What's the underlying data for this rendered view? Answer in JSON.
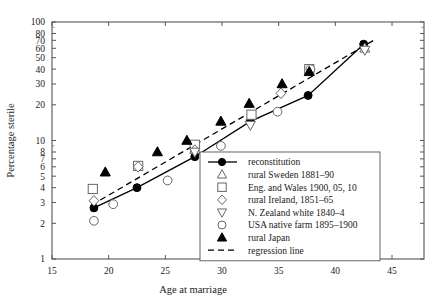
{
  "chart_data": {
    "type": "scatter",
    "title": "",
    "xlabel": "Age at marriage",
    "ylabel": "Percentage sterile",
    "xlim": [
      15,
      45
    ],
    "ylim": [
      1,
      100
    ],
    "yscale": "log",
    "grid": false,
    "legend_position": "bottom-right",
    "x_ticks": [
      15,
      20,
      25,
      30,
      35,
      40,
      45
    ],
    "y_ticks": [
      1,
      2,
      3,
      4,
      5,
      6,
      7,
      8,
      10,
      20,
      30,
      40,
      50,
      60,
      70,
      80,
      100
    ],
    "series": [
      {
        "name": "reconstitution",
        "marker": "filled-circle",
        "line": "solid",
        "points": [
          {
            "x": 18.7,
            "y": 2.7
          },
          {
            "x": 22.5,
            "y": 4.0
          },
          {
            "x": 27.6,
            "y": 7.3
          },
          {
            "x": 32.5,
            "y": 14.5
          },
          {
            "x": 37.6,
            "y": 24.0
          },
          {
            "x": 42.5,
            "y": 65.0
          }
        ]
      },
      {
        "name": "rural Sweden 1881–90",
        "marker": "triangle-up-open",
        "line": "none",
        "points": [
          {
            "x": 27.6,
            "y": 8.4
          },
          {
            "x": 42.6,
            "y": 60.0
          }
        ]
      },
      {
        "name": "Eng. and Wales 1900, 05, 10",
        "marker": "square-open",
        "line": "none",
        "points": [
          {
            "x": 18.6,
            "y": 3.9
          },
          {
            "x": 22.6,
            "y": 6.1
          },
          {
            "x": 27.6,
            "y": 9.2
          },
          {
            "x": 32.6,
            "y": 16.5
          },
          {
            "x": 37.7,
            "y": 40.0
          }
        ]
      },
      {
        "name": "rural Ireland, 1851–65",
        "marker": "diamond-open",
        "line": "none",
        "points": [
          {
            "x": 18.7,
            "y": 3.1
          },
          {
            "x": 22.6,
            "y": 6.0
          },
          {
            "x": 27.6,
            "y": 8.3
          },
          {
            "x": 35.2,
            "y": 25.0
          }
        ]
      },
      {
        "name": "N. Zealand white 1840–4",
        "marker": "triangle-down-open",
        "line": "none",
        "points": [
          {
            "x": 27.6,
            "y": 8.0
          },
          {
            "x": 32.5,
            "y": 13.5
          },
          {
            "x": 42.6,
            "y": 58.0
          }
        ]
      },
      {
        "name": "USA native farm 1895–1900",
        "marker": "circle-open",
        "line": "none",
        "points": [
          {
            "x": 18.7,
            "y": 2.1
          },
          {
            "x": 20.4,
            "y": 2.9
          },
          {
            "x": 25.2,
            "y": 4.6
          },
          {
            "x": 29.9,
            "y": 9.0
          },
          {
            "x": 34.9,
            "y": 17.5
          },
          {
            "x": 37.8,
            "y": 40.0
          }
        ]
      },
      {
        "name": "rural Japan",
        "marker": "triangle-up-filled",
        "line": "none",
        "points": [
          {
            "x": 19.7,
            "y": 5.4
          },
          {
            "x": 24.3,
            "y": 8.0
          },
          {
            "x": 26.9,
            "y": 10.0
          },
          {
            "x": 29.9,
            "y": 14.5
          },
          {
            "x": 32.4,
            "y": 20.5
          },
          {
            "x": 35.3,
            "y": 30.0
          },
          {
            "x": 37.7,
            "y": 38.0
          }
        ]
      }
    ],
    "regression_line": {
      "name": "regression line",
      "style": "dashed",
      "endpoints": [
        {
          "x": 18.5,
          "y": 2.85
        },
        {
          "x": 43.6,
          "y": 72.0
        }
      ]
    },
    "legend": [
      {
        "label": "reconstitution",
        "marker": "filled-circle-line"
      },
      {
        "label": "rural Sweden 1881–90",
        "marker": "triangle-up-open"
      },
      {
        "label": "Eng. and Wales 1900, 05, 10",
        "marker": "square-open"
      },
      {
        "label": "rural Ireland, 1851–65",
        "marker": "diamond-open"
      },
      {
        "label": "N. Zealand white 1840–4",
        "marker": "triangle-down-open"
      },
      {
        "label": "USA native farm 1895–1900",
        "marker": "circle-open"
      },
      {
        "label": "rural Japan",
        "marker": "triangle-up-filled"
      },
      {
        "label": "regression line",
        "marker": "dashed-line"
      }
    ]
  }
}
